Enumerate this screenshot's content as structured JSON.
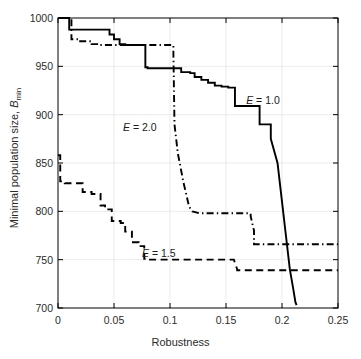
{
  "chart_data": {
    "type": "line",
    "title": "",
    "xlabel": "Robustness",
    "ylabel": "Minimal population size, B_min",
    "ylabel_main": "Minimal population size, ",
    "ylabel_italic": "B",
    "ylabel_sub": "min",
    "xlim": [
      0,
      0.25
    ],
    "ylim": [
      700,
      1000
    ],
    "xticks": [
      0,
      0.05,
      0.1,
      0.15,
      0.2,
      0.25
    ],
    "xticklabels": [
      "0",
      "0.05",
      "0.1",
      "0.15",
      "0.2",
      "0.25"
    ],
    "yticks": [
      700,
      750,
      800,
      850,
      900,
      950,
      1000
    ],
    "yticklabels": [
      "700",
      "750",
      "800",
      "850",
      "900",
      "950",
      "1000"
    ],
    "grid": true,
    "grid_color": "#e6e6e6",
    "axes_color": "#000000",
    "background": "#ffffff",
    "legend": "inline-annotations",
    "series": [
      {
        "name": "E = 1.0",
        "label": "E = 1.0",
        "label_italic": "E",
        "label_rest": " = 1.0",
        "style": "solid",
        "color": "#000000",
        "annotation_x": 0.168,
        "annotation_y": 915,
        "x": [
          0,
          0.01,
          0.01,
          0.013,
          0.013,
          0.046,
          0.046,
          0.05,
          0.05,
          0.055,
          0.055,
          0.06,
          0.06,
          0.078,
          0.078,
          0.08,
          0.08,
          0.103,
          0.103,
          0.11,
          0.11,
          0.118,
          0.118,
          0.122,
          0.122,
          0.128,
          0.128,
          0.134,
          0.134,
          0.14,
          0.14,
          0.146,
          0.146,
          0.152,
          0.152,
          0.158,
          0.158,
          0.172,
          0.172,
          0.18,
          0.18,
          0.19,
          0.19,
          0.196,
          0.2,
          0.204,
          0.207,
          0.21,
          0.212,
          0.213
        ],
        "y": [
          1000,
          1000,
          988,
          988,
          988,
          988,
          983,
          983,
          978,
          978,
          973,
          973,
          972,
          972,
          949,
          949,
          948,
          948,
          948,
          948,
          944,
          944,
          943,
          943,
          939,
          939,
          936,
          936,
          933,
          933,
          930,
          930,
          929,
          929,
          928,
          928,
          909,
          909,
          909,
          909,
          890,
          890,
          875,
          850,
          810,
          770,
          740,
          720,
          706,
          703
        ]
      },
      {
        "name": "E = 1.5",
        "label": "E = 1.5",
        "label_italic": "E",
        "label_rest": " = 1.5",
        "style": "dashed",
        "color": "#000000",
        "annotation_x": 0.075,
        "annotation_y": 757,
        "x": [
          0,
          0.002,
          0.002,
          0.006,
          0.006,
          0.022,
          0.022,
          0.03,
          0.03,
          0.038,
          0.038,
          0.042,
          0.042,
          0.048,
          0.048,
          0.056,
          0.056,
          0.06,
          0.06,
          0.066,
          0.066,
          0.072,
          0.072,
          0.077,
          0.077,
          0.081,
          0.081,
          0.157,
          0.157,
          0.16,
          0.16,
          0.25
        ],
        "y": [
          858,
          858,
          831,
          831,
          829,
          829,
          820,
          820,
          818,
          818,
          806,
          806,
          802,
          802,
          790,
          790,
          788,
          788,
          779,
          779,
          768,
          768,
          764,
          764,
          751,
          751,
          750,
          750,
          750,
          740,
          739,
          739
        ]
      },
      {
        "name": "E = 2.0",
        "label": "E = 2.0",
        "label_italic": "E",
        "label_rest": " = 2.0",
        "style": "dashdot",
        "color": "#000000",
        "annotation_x": 0.058,
        "annotation_y": 887,
        "x": [
          0,
          0.012,
          0.012,
          0.018,
          0.018,
          0.03,
          0.03,
          0.036,
          0.036,
          0.103,
          0.103,
          0.104,
          0.107,
          0.112,
          0.117,
          0.12,
          0.126,
          0.126,
          0.172,
          0.172,
          0.175,
          0.175,
          0.25
        ],
        "y": [
          1000,
          1000,
          978,
          978,
          976,
          976,
          973,
          973,
          972,
          972,
          966,
          890,
          860,
          830,
          805,
          800,
          798,
          798,
          798,
          795,
          780,
          766,
          766
        ]
      }
    ]
  },
  "axes_geometry": {
    "left": 58,
    "top": 18,
    "right": 338,
    "bottom": 308
  }
}
